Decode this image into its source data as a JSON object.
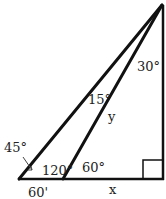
{
  "diagram": {
    "type": "geometry-triangle",
    "colors": {
      "stroke": "#111111",
      "text": "#222222",
      "background": "#ffffff"
    },
    "points": {
      "apex": [
        162,
        5
      ],
      "left_base": [
        19,
        179
      ],
      "mid_base": [
        63,
        179
      ],
      "right_corner": [
        163,
        179
      ]
    },
    "labels": {
      "apex_angle": "30°",
      "inner_angle": "15°",
      "side_y": "y",
      "left_angle": "45°",
      "obtuse_angle": "120°",
      "acute_angle": "60°",
      "base_left_length": "60'",
      "base_right_length": "x"
    },
    "right_angle_marker": true
  }
}
